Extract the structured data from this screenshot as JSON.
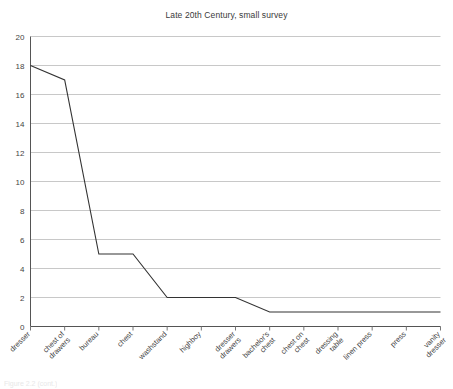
{
  "chart_data": {
    "type": "line",
    "title": "Late 20th Century, small survey",
    "xlabel": "",
    "ylabel": "",
    "ylim": [
      0,
      20
    ],
    "ytick_step": 2,
    "yticks": [
      0,
      2,
      4,
      6,
      8,
      10,
      12,
      14,
      16,
      18,
      20
    ],
    "grid": true,
    "legend": "none",
    "line_color": "#333333",
    "grid_color": "#c8c8c8",
    "categories": [
      "dresser",
      "chest of drawers",
      "bureau",
      "chest",
      "washstand",
      "highboy",
      "dresser drawers",
      "bachelor's chest",
      "chest on chest",
      "dressing table",
      "linen press",
      "press",
      "vanity dresser"
    ],
    "category_lines": [
      [
        "dresser"
      ],
      [
        "chest of",
        "drawers"
      ],
      [
        "bureau"
      ],
      [
        "chest"
      ],
      [
        "washstand"
      ],
      [
        "highboy"
      ],
      [
        "dresser",
        "drawers"
      ],
      [
        "bachelor's",
        "chest"
      ],
      [
        "chest on",
        "chest"
      ],
      [
        "dressing",
        "table"
      ],
      [
        "linen press"
      ],
      [
        "press"
      ],
      [
        "vanity",
        "dresser"
      ]
    ],
    "values": [
      18,
      17,
      5,
      5,
      2,
      2,
      2,
      1,
      1,
      1,
      1,
      1,
      1
    ]
  },
  "caption": {
    "text": "Figure 2.2 (cont.)"
  }
}
